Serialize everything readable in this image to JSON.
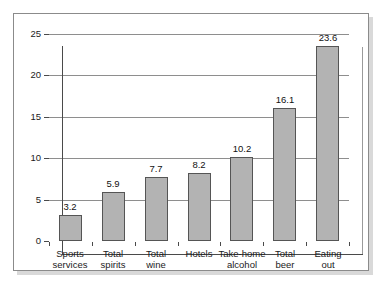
{
  "chart_data": {
    "type": "bar",
    "title": "",
    "subtitle": "",
    "xlabel": "",
    "ylabel": "",
    "categories": [
      "Sports\nservices",
      "Total\nspirits",
      "Total\nwine",
      "Hotels",
      "Take-home\nalcohol",
      "Total\nbeer",
      "Eating\nout"
    ],
    "category_lines": [
      [
        "Sports",
        "services"
      ],
      [
        "Total",
        "spirits"
      ],
      [
        "Total",
        "wine"
      ],
      [
        "Hotels",
        ""
      ],
      [
        "Take-home",
        "alcohol"
      ],
      [
        "Total",
        "beer"
      ],
      [
        "Eating",
        "out"
      ]
    ],
    "values": [
      3.2,
      5.9,
      7.7,
      8.2,
      10.2,
      16.1,
      23.6
    ],
    "value_labels": [
      "3.2",
      "5.9",
      "7.7",
      "8.2",
      "10.2",
      "16.1",
      "23.6"
    ],
    "ylim": [
      0,
      25
    ],
    "yticks": [
      0,
      5,
      10,
      15,
      20,
      25
    ],
    "ytick_labels": [
      "0",
      "5",
      "10",
      "15",
      "20",
      "25"
    ],
    "grid": true,
    "grid_axis": "y",
    "legend": "none",
    "bar_color": "#b3b3b3",
    "bar_border_color": "#555555",
    "axis_color": "#4a4a4a",
    "grid_color": "#8e8e8e",
    "background": "#ffffff",
    "frame_border_color": "#8b8b8b",
    "shadow_color": "#d9d9d9"
  }
}
